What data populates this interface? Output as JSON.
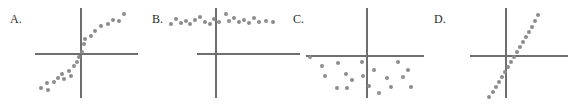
{
  "figure": {
    "width": 569,
    "height": 106,
    "background": "#ffffff",
    "dot_color": "#8c8c8c",
    "axis_color": "#6e6e6e",
    "label_color": "#2b2b2b"
  },
  "chart_data": [
    {
      "type": "scatter",
      "label": "A.",
      "title": "",
      "xlabel": "",
      "ylabel": "",
      "description": "Moderate positive linear association with scatter",
      "grid": false,
      "legend": "none",
      "panel": {
        "left": 0,
        "width": 145
      },
      "label_pos": {
        "x": 10,
        "y": 13
      },
      "axes": {
        "h": {
          "x": 35,
          "y": 53,
          "length": 103
        },
        "v": {
          "x": 80,
          "y": 8,
          "length": 90
        }
      },
      "xlim": [
        0,
        145
      ],
      "ylim": [
        0,
        106
      ],
      "points": [
        {
          "x": 41,
          "y": 88
        },
        {
          "x": 48,
          "y": 90
        },
        {
          "x": 47,
          "y": 83
        },
        {
          "x": 54,
          "y": 82
        },
        {
          "x": 58,
          "y": 78
        },
        {
          "x": 62,
          "y": 74
        },
        {
          "x": 64,
          "y": 79
        },
        {
          "x": 69,
          "y": 71
        },
        {
          "x": 71,
          "y": 76
        },
        {
          "x": 74,
          "y": 66
        },
        {
          "x": 77,
          "y": 62
        },
        {
          "x": 79,
          "y": 57
        },
        {
          "x": 82,
          "y": 52
        },
        {
          "x": 84,
          "y": 44
        },
        {
          "x": 85,
          "y": 39
        },
        {
          "x": 91,
          "y": 36
        },
        {
          "x": 95,
          "y": 31
        },
        {
          "x": 101,
          "y": 26
        },
        {
          "x": 108,
          "y": 24
        },
        {
          "x": 113,
          "y": 20
        },
        {
          "x": 119,
          "y": 21
        },
        {
          "x": 124,
          "y": 14
        }
      ]
    },
    {
      "type": "scatter",
      "label": "B.",
      "title": "",
      "xlabel": "",
      "ylabel": "",
      "description": "No association; points form a flat horizontal band high above the x-axis",
      "grid": false,
      "legend": "none",
      "panel": {
        "left": 145,
        "width": 145
      },
      "label_pos": {
        "x": 152,
        "y": 13
      },
      "axes": {
        "h": {
          "x": 52,
          "y": 53,
          "length": 103
        },
        "v": {
          "x": 70,
          "y": 8,
          "length": 90
        }
      },
      "xlim": [
        0,
        145
      ],
      "ylim": [
        0,
        106
      ],
      "points": [
        {
          "x": 171,
          "y": 24
        },
        {
          "x": 176,
          "y": 19
        },
        {
          "x": 181,
          "y": 23
        },
        {
          "x": 186,
          "y": 21
        },
        {
          "x": 190,
          "y": 24
        },
        {
          "x": 195,
          "y": 20
        },
        {
          "x": 200,
          "y": 17
        },
        {
          "x": 205,
          "y": 22
        },
        {
          "x": 210,
          "y": 24
        },
        {
          "x": 214,
          "y": 19
        },
        {
          "x": 219,
          "y": 22
        },
        {
          "x": 226,
          "y": 14
        },
        {
          "x": 229,
          "y": 21
        },
        {
          "x": 234,
          "y": 18
        },
        {
          "x": 239,
          "y": 22
        },
        {
          "x": 244,
          "y": 20
        },
        {
          "x": 249,
          "y": 23
        },
        {
          "x": 254,
          "y": 18
        },
        {
          "x": 259,
          "y": 22
        },
        {
          "x": 266,
          "y": 21
        },
        {
          "x": 273,
          "y": 22
        }
      ]
    },
    {
      "type": "scatter",
      "label": "C.",
      "title": "",
      "xlabel": "",
      "ylabel": "",
      "description": "No association; random cloud of points below the x-axis",
      "grid": false,
      "legend": "none",
      "panel": {
        "left": 290,
        "width": 140
      },
      "label_pos": {
        "x": 293,
        "y": 13
      },
      "axes": {
        "h": {
          "x": 16,
          "y": 55,
          "length": 118
        },
        "v": {
          "x": 76,
          "y": 8,
          "length": 90
        }
      },
      "xlim": [
        0,
        140
      ],
      "ylim": [
        0,
        106
      ],
      "points": [
        {
          "x": 310,
          "y": 57
        },
        {
          "x": 322,
          "y": 66
        },
        {
          "x": 325,
          "y": 76
        },
        {
          "x": 338,
          "y": 63
        },
        {
          "x": 337,
          "y": 88
        },
        {
          "x": 346,
          "y": 74
        },
        {
          "x": 352,
          "y": 80
        },
        {
          "x": 347,
          "y": 88
        },
        {
          "x": 362,
          "y": 62
        },
        {
          "x": 363,
          "y": 76
        },
        {
          "x": 369,
          "y": 86
        },
        {
          "x": 374,
          "y": 70
        },
        {
          "x": 379,
          "y": 93
        },
        {
          "x": 387,
          "y": 78
        },
        {
          "x": 391,
          "y": 87
        },
        {
          "x": 398,
          "y": 62
        },
        {
          "x": 403,
          "y": 77
        },
        {
          "x": 408,
          "y": 70
        },
        {
          "x": 411,
          "y": 87
        }
      ]
    },
    {
      "type": "scatter",
      "label": "D.",
      "title": "",
      "xlabel": "",
      "ylabel": "",
      "description": "Strong steep positive linear association, very tight about the line",
      "grid": false,
      "legend": "none",
      "panel": {
        "left": 430,
        "width": 139
      },
      "label_pos": {
        "x": 434,
        "y": 13
      },
      "axes": {
        "h": {
          "x": 40,
          "y": 55,
          "length": 98
        },
        "v": {
          "x": 75,
          "y": 8,
          "length": 90
        }
      },
      "xlim": [
        0,
        139
      ],
      "ylim": [
        0,
        106
      ],
      "points": [
        {
          "x": 489,
          "y": 97
        },
        {
          "x": 493,
          "y": 92
        },
        {
          "x": 496,
          "y": 87
        },
        {
          "x": 499,
          "y": 82
        },
        {
          "x": 502,
          "y": 77
        },
        {
          "x": 505,
          "y": 72
        },
        {
          "x": 508,
          "y": 67
        },
        {
          "x": 511,
          "y": 62
        },
        {
          "x": 514,
          "y": 57
        },
        {
          "x": 517,
          "y": 52
        },
        {
          "x": 520,
          "y": 47
        },
        {
          "x": 523,
          "y": 42
        },
        {
          "x": 526,
          "y": 37
        },
        {
          "x": 529,
          "y": 32
        },
        {
          "x": 532,
          "y": 27
        },
        {
          "x": 535,
          "y": 21
        },
        {
          "x": 538,
          "y": 15
        }
      ]
    }
  ]
}
